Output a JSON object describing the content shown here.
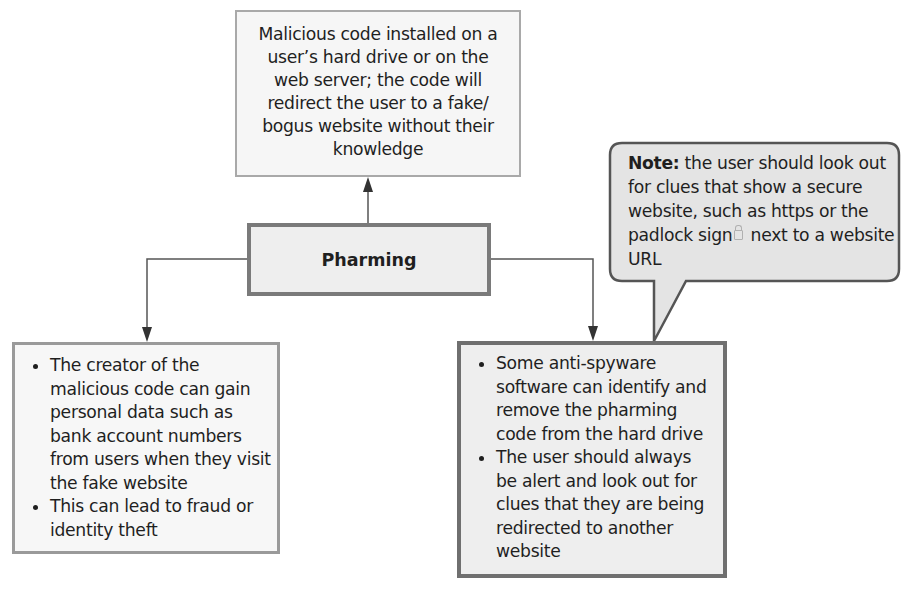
{
  "diagram": {
    "title": "Pharming",
    "definition": "Malicious code installed on a user’s hard drive or on the web server; the code will redirect the user to a fake/ bogus website without their knowledge",
    "definition_lines": [
      "Malicious code installed on a",
      "user’s hard drive or on the",
      "web server; the code will",
      "redirect the user to a fake/",
      "bogus website without their",
      "knowledge"
    ],
    "consequences": {
      "bullets": [
        "The creator of the malicious code can gain personal data such as bank account numbers from users when they visit the fake website",
        "This can lead to fraud or identity theft"
      ]
    },
    "prevention": {
      "bullets": [
        "Some anti-spyware software can identify and remove the pharming code from the hard drive",
        "The user should always be alert and look out for clues that they are being redirected to another website"
      ]
    },
    "note": {
      "label": "Note:",
      "text_before_icon": " the user should look out for clues that show a secure website, such as https or the padlock sign",
      "icon": "padlock-icon",
      "text_after_icon": " next to a website URL"
    },
    "colors": {
      "center_fill": "#eeeeee",
      "center_border": "#7a7a7a",
      "note_fill": "#e4e4e4",
      "line": "#555555"
    }
  }
}
